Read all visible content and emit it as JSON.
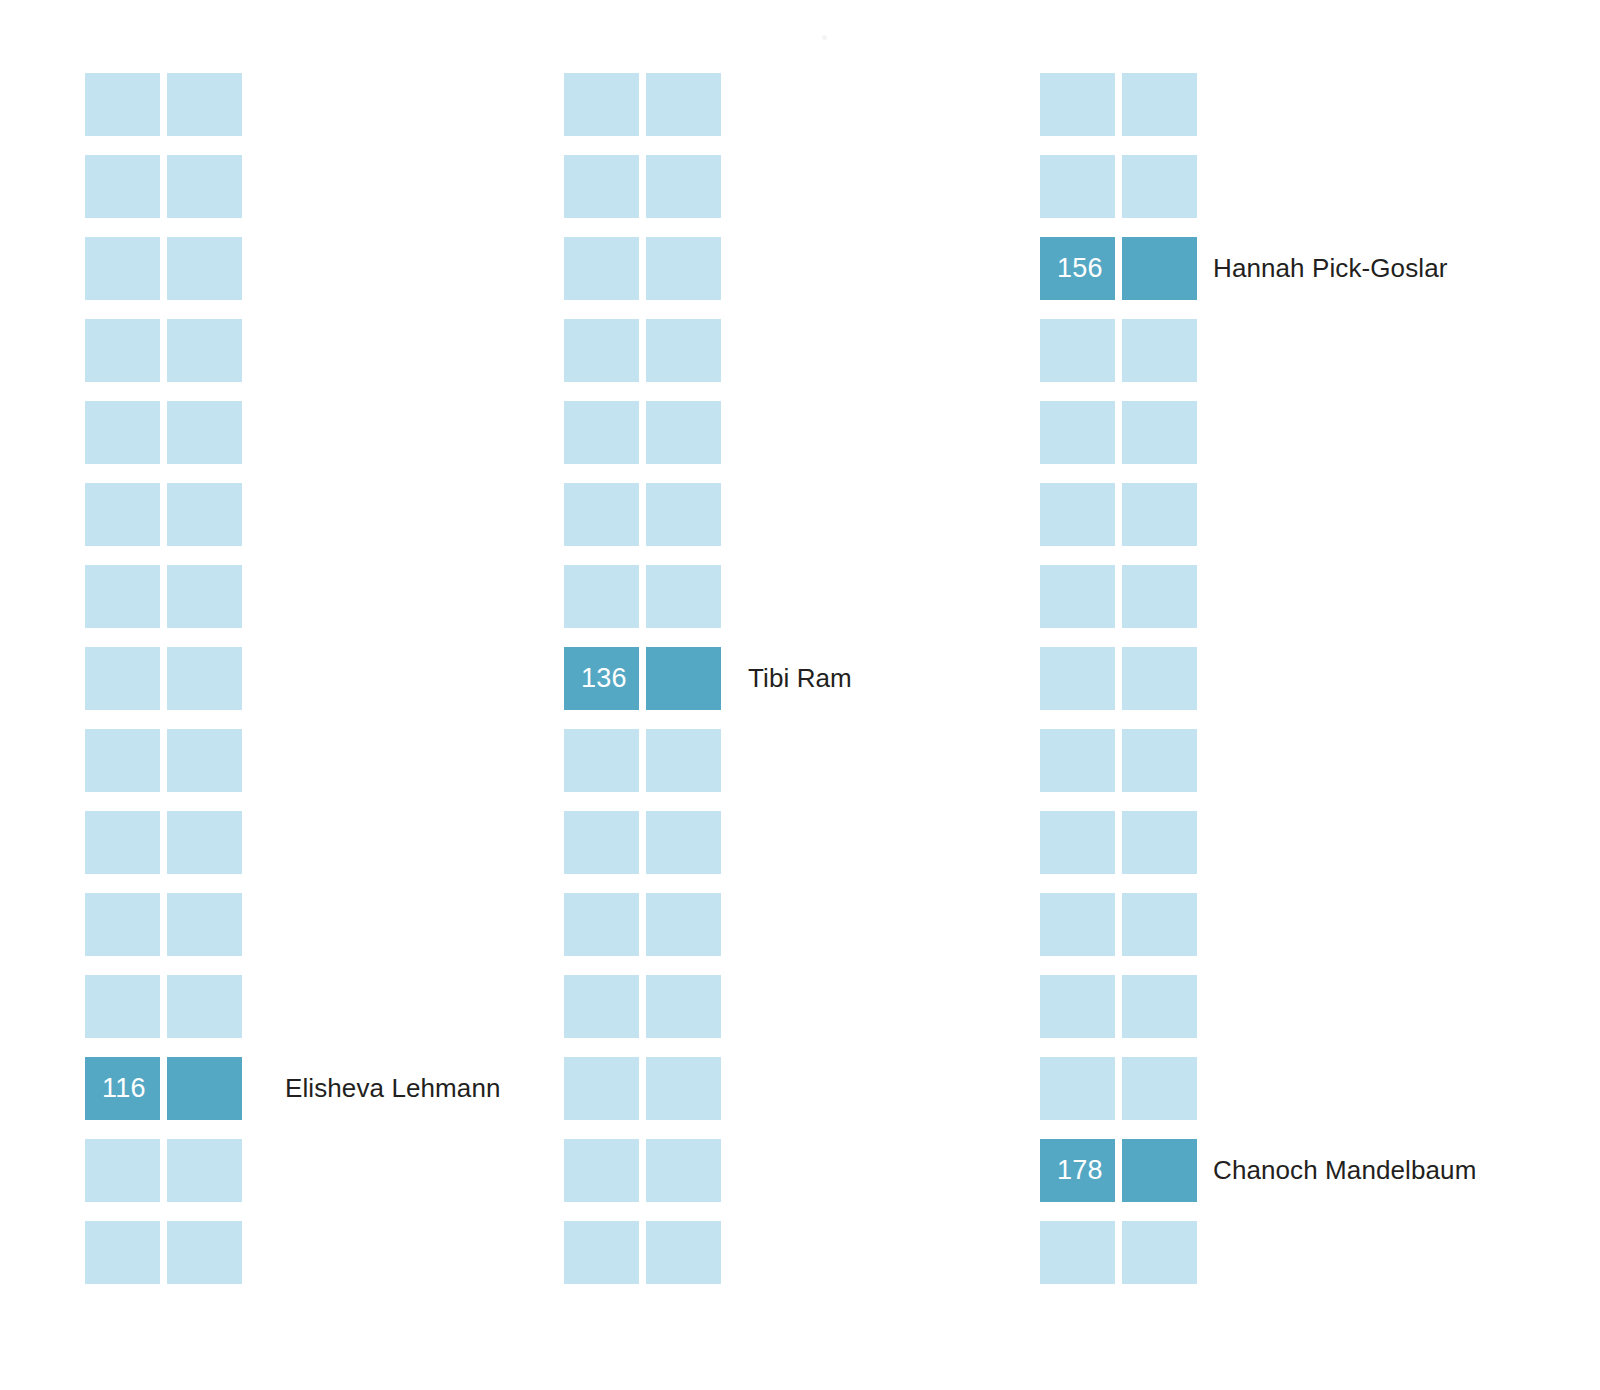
{
  "chart_data": {
    "type": "heatmap",
    "title": "",
    "subtitle": "",
    "xlabel": "",
    "ylabel": "",
    "grid": false,
    "legend_position": "none",
    "layout": {
      "columns": 3,
      "rows_per_column": 15,
      "cells_per_row": 2,
      "cell_width_px": 75,
      "cell_height_px": 63,
      "cell_gap_px": 7,
      "row_pitch_px": 82,
      "first_row_top_px": 73,
      "column_left_px": [
        85,
        564,
        1040
      ]
    },
    "colors": {
      "background": "#ffffff",
      "cell_default": "#c3e3f0",
      "cell_highlight": "#55a8c4",
      "value_text": "#ffffff",
      "label_text": "#231f20"
    },
    "columns": [
      {
        "index": 0,
        "rows": [
          {
            "row": 0,
            "value": null,
            "label": "",
            "highlight": false
          },
          {
            "row": 1,
            "value": null,
            "label": "",
            "highlight": false
          },
          {
            "row": 2,
            "value": null,
            "label": "",
            "highlight": false
          },
          {
            "row": 3,
            "value": null,
            "label": "",
            "highlight": false
          },
          {
            "row": 4,
            "value": null,
            "label": "",
            "highlight": false
          },
          {
            "row": 5,
            "value": null,
            "label": "",
            "highlight": false
          },
          {
            "row": 6,
            "value": null,
            "label": "",
            "highlight": false
          },
          {
            "row": 7,
            "value": null,
            "label": "",
            "highlight": false
          },
          {
            "row": 8,
            "value": null,
            "label": "",
            "highlight": false
          },
          {
            "row": 9,
            "value": null,
            "label": "",
            "highlight": false
          },
          {
            "row": 10,
            "value": null,
            "label": "",
            "highlight": false
          },
          {
            "row": 11,
            "value": null,
            "label": "",
            "highlight": false
          },
          {
            "row": 12,
            "value": "116",
            "label": "Elisheva Lehmann",
            "highlight": true
          },
          {
            "row": 13,
            "value": null,
            "label": "",
            "highlight": false
          },
          {
            "row": 14,
            "value": null,
            "label": "",
            "highlight": false
          }
        ]
      },
      {
        "index": 1,
        "rows": [
          {
            "row": 0,
            "value": null,
            "label": "",
            "highlight": false
          },
          {
            "row": 1,
            "value": null,
            "label": "",
            "highlight": false
          },
          {
            "row": 2,
            "value": null,
            "label": "",
            "highlight": false
          },
          {
            "row": 3,
            "value": null,
            "label": "",
            "highlight": false
          },
          {
            "row": 4,
            "value": null,
            "label": "",
            "highlight": false
          },
          {
            "row": 5,
            "value": null,
            "label": "",
            "highlight": false
          },
          {
            "row": 6,
            "value": null,
            "label": "",
            "highlight": false
          },
          {
            "row": 7,
            "value": "136",
            "label": "Tibi Ram",
            "highlight": true
          },
          {
            "row": 8,
            "value": null,
            "label": "",
            "highlight": false
          },
          {
            "row": 9,
            "value": null,
            "label": "",
            "highlight": false
          },
          {
            "row": 10,
            "value": null,
            "label": "",
            "highlight": false
          },
          {
            "row": 11,
            "value": null,
            "label": "",
            "highlight": false
          },
          {
            "row": 12,
            "value": null,
            "label": "",
            "highlight": false
          },
          {
            "row": 13,
            "value": null,
            "label": "",
            "highlight": false
          },
          {
            "row": 14,
            "value": null,
            "label": "",
            "highlight": false
          }
        ]
      },
      {
        "index": 2,
        "rows": [
          {
            "row": 0,
            "value": null,
            "label": "",
            "highlight": false
          },
          {
            "row": 1,
            "value": null,
            "label": "",
            "highlight": false
          },
          {
            "row": 2,
            "value": "156",
            "label": "Hannah Pick-Goslar",
            "highlight": true
          },
          {
            "row": 3,
            "value": null,
            "label": "",
            "highlight": false
          },
          {
            "row": 4,
            "value": null,
            "label": "",
            "highlight": false
          },
          {
            "row": 5,
            "value": null,
            "label": "",
            "highlight": false
          },
          {
            "row": 6,
            "value": null,
            "label": "",
            "highlight": false
          },
          {
            "row": 7,
            "value": null,
            "label": "",
            "highlight": false
          },
          {
            "row": 8,
            "value": null,
            "label": "",
            "highlight": false
          },
          {
            "row": 9,
            "value": null,
            "label": "",
            "highlight": false
          },
          {
            "row": 10,
            "value": null,
            "label": "",
            "highlight": false
          },
          {
            "row": 11,
            "value": null,
            "label": "",
            "highlight": false
          },
          {
            "row": 12,
            "value": null,
            "label": "",
            "highlight": false
          },
          {
            "row": 13,
            "value": "178",
            "label": "Chanoch Mandelbaum",
            "highlight": true
          },
          {
            "row": 14,
            "value": null,
            "label": "",
            "highlight": false
          }
        ]
      }
    ],
    "highlighted": [
      {
        "value": 116,
        "label": "Elisheva Lehmann",
        "column": 0,
        "row": 12
      },
      {
        "value": 136,
        "label": "Tibi Ram",
        "column": 1,
        "row": 7
      },
      {
        "value": 156,
        "label": "Hannah Pick-Goslar",
        "column": 2,
        "row": 2
      },
      {
        "value": 178,
        "label": "Chanoch Mandelbaum",
        "column": 2,
        "row": 13
      }
    ]
  }
}
